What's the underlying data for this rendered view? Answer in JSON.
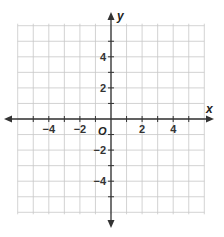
{
  "diagram": {
    "type": "coordinate-plane",
    "x_axis": {
      "label": "x",
      "min": -6,
      "max": 6,
      "tick_labels": [
        "−4",
        "−2",
        "2",
        "4"
      ],
      "tick_values": [
        -4,
        -2,
        2,
        4
      ]
    },
    "y_axis": {
      "label": "y",
      "min": -6,
      "max": 6,
      "tick_labels": [
        "4",
        "2",
        "−2",
        "−4"
      ],
      "tick_values": [
        4,
        2,
        -2,
        -4
      ]
    },
    "origin_label": "O",
    "grid": {
      "step": 1,
      "color": "#c8c8c8"
    },
    "axis_color": "#333333"
  }
}
